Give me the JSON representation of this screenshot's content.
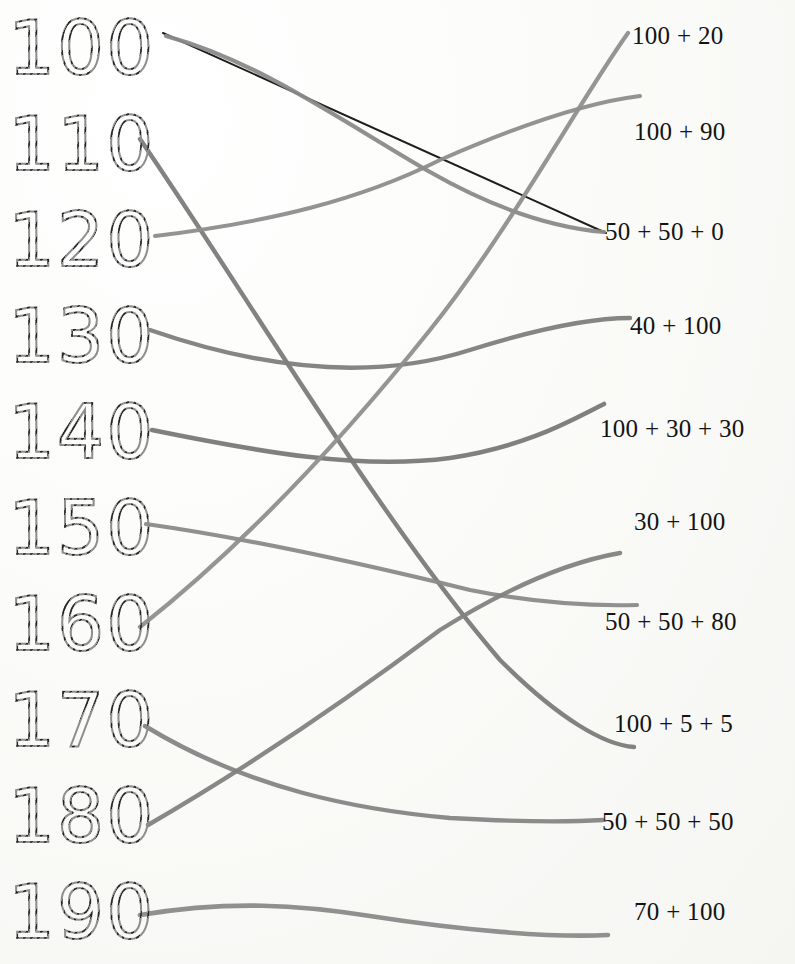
{
  "worksheet": {
    "type": "matching-worksheet",
    "title_visible": false,
    "background_color": "#fdfdfb",
    "trace_dot_color": "#1d1d1d",
    "trace_ghost_color": "#8e8e8e",
    "print_color": "#131313",
    "pencil_color": "#7d7d7d",
    "pen_color": "#111111"
  },
  "left_column": {
    "name": "numbers-column",
    "items": [
      {
        "id": "num-100",
        "label": "100",
        "top": 0,
        "anchor_x": 163,
        "anchor_y": 33
      },
      {
        "id": "num-110",
        "label": "110",
        "top": 96,
        "anchor_x": 140,
        "anchor_y": 139
      },
      {
        "id": "num-120",
        "label": "120",
        "top": 192,
        "anchor_x": 155,
        "anchor_y": 236
      },
      {
        "id": "num-130",
        "label": "130",
        "top": 288,
        "anchor_x": 150,
        "anchor_y": 330
      },
      {
        "id": "num-140",
        "label": "140",
        "top": 384,
        "anchor_x": 152,
        "anchor_y": 430
      },
      {
        "id": "num-150",
        "label": "150",
        "top": 480,
        "anchor_x": 146,
        "anchor_y": 524
      },
      {
        "id": "num-160",
        "label": "160",
        "top": 576,
        "anchor_x": 140,
        "anchor_y": 627
      },
      {
        "id": "num-170",
        "label": "170",
        "top": 672,
        "anchor_x": 145,
        "anchor_y": 726
      },
      {
        "id": "num-180",
        "label": "180",
        "top": 768,
        "anchor_x": 148,
        "anchor_y": 825
      },
      {
        "id": "num-190",
        "label": "190",
        "top": 864,
        "anchor_x": 140,
        "anchor_y": 915
      }
    ]
  },
  "right_column": {
    "name": "expressions-column",
    "items": [
      {
        "id": "expr-120",
        "label": "100 + 20",
        "left": 32,
        "top": 22,
        "anchor_x": 628,
        "anchor_y": 33
      },
      {
        "id": "expr-190",
        "label": "100 + 90",
        "left": 34,
        "top": 118,
        "anchor_x": 640,
        "anchor_y": 96
      },
      {
        "id": "expr-100",
        "label": "50 + 50 + 0",
        "left": 5,
        "top": 218,
        "anchor_x": 606,
        "anchor_y": 233
      },
      {
        "id": "expr-140",
        "label": "40 + 100",
        "left": 30,
        "top": 312,
        "anchor_x": 630,
        "anchor_y": 318
      },
      {
        "id": "expr-160",
        "label": "100 + 30 + 30",
        "left": 0,
        "top": 415,
        "anchor_x": 604,
        "anchor_y": 404
      },
      {
        "id": "expr-130",
        "label": "30 + 100",
        "left": 34,
        "top": 508,
        "anchor_x": 620,
        "anchor_y": 553
      },
      {
        "id": "expr-180",
        "label": "50 + 50 + 80",
        "left": 5,
        "top": 608,
        "anchor_x": 637,
        "anchor_y": 605
      },
      {
        "id": "expr-110",
        "label": "100 + 5 + 5",
        "left": 14,
        "top": 710,
        "anchor_x": 634,
        "anchor_y": 747
      },
      {
        "id": "expr-150",
        "label": "50 + 50 + 50",
        "left": 2,
        "top": 808,
        "anchor_x": 603,
        "anchor_y": 820
      },
      {
        "id": "expr-170",
        "label": "70 + 100",
        "left": 34,
        "top": 898,
        "anchor_x": 608,
        "anchor_y": 935
      }
    ]
  },
  "connections": [
    {
      "id": "line-100-to-50-50-0",
      "from": "num-100",
      "to": "expr-100",
      "color": "#111111",
      "width": 2.0,
      "path": "M 163 33 L 606 233"
    },
    {
      "id": "line-100b-curve",
      "from": "num-100",
      "to": "expr-100",
      "color": "#8a8a8a",
      "width": 4.2,
      "path": "M 166 36 C 260 62 340 120 430 172 C 500 212 560 228 604 232"
    },
    {
      "id": "line-110-to-100-5-5",
      "from": "num-110",
      "to": "expr-110",
      "color": "#7b7b7b",
      "width": 4.4,
      "path": "M 140 139 C 250 300 380 520 500 660 C 560 720 605 745 634 747"
    },
    {
      "id": "line-120-to-100-90",
      "from": "num-120",
      "to": "expr-190",
      "color": "#8d8d8d",
      "width": 4.0,
      "path": "M 155 236 C 270 222 360 200 440 160 C 520 125 590 102 640 96"
    },
    {
      "id": "line-130-to-40-100",
      "from": "num-130",
      "to": "expr-140",
      "color": "#7e7e7e",
      "width": 4.4,
      "path": "M 150 330 C 260 368 370 382 470 350 C 540 328 595 318 630 318"
    },
    {
      "id": "line-140-to-100-30-30",
      "from": "num-140",
      "to": "expr-160",
      "color": "#797979",
      "width": 4.6,
      "path": "M 152 430 C 260 452 360 470 450 458 C 530 446 575 418 604 404"
    },
    {
      "id": "line-150-to-50-50-80",
      "from": "num-150",
      "to": "expr-180",
      "color": "#8a8a8a",
      "width": 4.2,
      "path": "M 146 524 C 260 540 380 568 470 590 C 540 604 600 606 637 605"
    },
    {
      "id": "line-160-to-120",
      "from": "num-160",
      "to": "expr-120",
      "color": "#8f8f8f",
      "width": 4.2,
      "path": "M 140 627 C 250 540 350 430 430 330 C 510 230 580 100 628 33"
    },
    {
      "id": "line-170-to-50-50-50",
      "from": "num-170",
      "to": "expr-150",
      "color": "#858585",
      "width": 4.4,
      "path": "M 145 726 C 250 790 360 810 450 818 C 520 822 570 822 603 820"
    },
    {
      "id": "line-180-to-30-100",
      "from": "num-180",
      "to": "expr-130",
      "color": "#828282",
      "width": 4.4,
      "path": "M 148 825 C 260 760 360 690 440 630 C 520 580 580 560 620 553"
    },
    {
      "id": "line-190-to-70-100",
      "from": "num-190",
      "to": "expr-170",
      "color": "#8a8a8a",
      "width": 4.6,
      "path": "M 140 915 C 230 900 300 905 370 916 C 460 930 550 938 608 935"
    }
  ]
}
